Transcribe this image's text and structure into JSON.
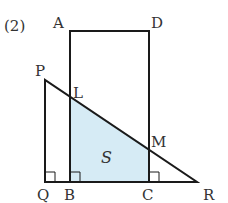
{
  "problem_number": "(2)",
  "points": {
    "A": {
      "label": "A",
      "x": 70,
      "y": 31
    },
    "D": {
      "label": "D",
      "x": 149,
      "y": 31
    },
    "B": {
      "label": "B",
      "x": 70,
      "y": 182
    },
    "C": {
      "label": "C",
      "x": 149,
      "y": 182
    },
    "P": {
      "label": "P",
      "x": 45,
      "y": 80
    },
    "Q": {
      "label": "Q",
      "x": 45,
      "y": 182
    },
    "R": {
      "label": "R",
      "x": 197,
      "y": 182
    },
    "L": {
      "label": "L",
      "x": 70,
      "y": 98
    },
    "M": {
      "label": "M",
      "x": 149,
      "y": 148
    }
  },
  "region": {
    "label": "S",
    "fill": "#d6ebf5"
  },
  "colors": {
    "stroke": "#1a1a1a",
    "text": "#333333"
  }
}
